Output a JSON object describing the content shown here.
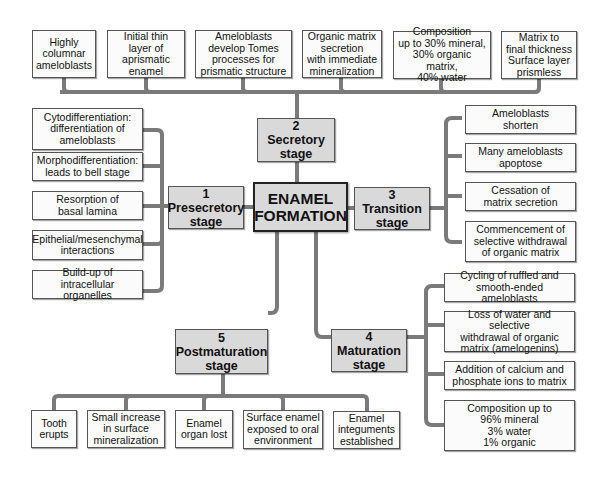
{
  "title": "ENAMEL FORMATION",
  "center": {
    "line1": "ENAMEL",
    "line2": "FORMATION"
  },
  "colors": {
    "connector": "#7a7a7a",
    "stage_fill": "#d9d9d9",
    "box_fill": "#fbfbfb",
    "border": "#555555"
  },
  "stages": [
    {
      "number": "1",
      "name": "Presecretory",
      "suffix": "stage",
      "items": [
        "Cytodifferentiation:\ndifferentiation of\nameloblasts",
        "Morphodifferentiation:\nleads to bell stage",
        "Resorption of\nbasal lamina",
        "Epithelial/mesenchymal\ninteractions",
        "Build-up of intracellular\norganelles"
      ]
    },
    {
      "number": "2",
      "name": "Secretory",
      "suffix": "stage",
      "items": [
        "Highly\ncolumnar\nameloblasts",
        "Initial thin\nlayer of\naprismatic\nenamel",
        "Ameloblasts\ndevelop Tomes\nprocesses for\nprismatic structure",
        "Organic matrix\nsecretion\nwith immediate\nmineralization",
        "Composition\nup to 30% mineral,\n30% organic matrix,\n40% water",
        "Matrix to\nfinal thickness\nSurface layer\nprismless"
      ]
    },
    {
      "number": "3",
      "name": "Transition",
      "suffix": "stage",
      "items": [
        "Ameloblasts\nshorten",
        "Many ameloblasts\napoptose",
        "Cessation of\nmatrix secretion",
        "Commencement of\nselective withdrawal\nof organic matrix"
      ]
    },
    {
      "number": "4",
      "name": "Maturation",
      "suffix": "stage",
      "items": [
        "Cycling of ruffled and\nsmooth-ended ameloblasts",
        "Loss of water and selective\nwithdrawal of organic\nmatrix (amelogenins)",
        "Addition of calcium and\nphosphate ions to matrix",
        "Composition up to\n96% mineral\n3% water\n1% organic"
      ]
    },
    {
      "number": "5",
      "name": "Postmaturation",
      "suffix": "stage",
      "items": [
        "Tooth\nerupts",
        "Small increase\nin surface\nmineralization",
        "Enamel\norgan lost",
        "Surface enamel\nexposed to oral\nenvironment",
        "Enamel\ninteguments\nestablished"
      ]
    }
  ]
}
